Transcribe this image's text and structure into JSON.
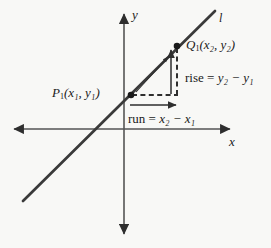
{
  "figure": {
    "type": "coordinate-plane-slope-diagram",
    "background_color": "#f8f8f6",
    "ink_color": "#3a3a3a",
    "text_color": "#1a1a1a",
    "width": 271,
    "height": 248
  },
  "axes": {
    "x_label": "x",
    "y_label": "y",
    "origin": {
      "x": 124,
      "y": 129
    },
    "x_axis": {
      "x1": 12,
      "y1": 129,
      "x2": 232,
      "y2": 129,
      "arrows": "both"
    },
    "y_axis": {
      "x1": 124,
      "y1": 12,
      "x2": 124,
      "y2": 236,
      "arrows": "both"
    }
  },
  "line": {
    "label": "l",
    "start": {
      "x": 23,
      "y": 201
    },
    "end": {
      "x": 215,
      "y": 11
    },
    "color": "#3a3a3a",
    "width": 2.6
  },
  "points": [
    {
      "id": "P1",
      "label": "P",
      "sub": "1",
      "coords": "(x₁, y₁)",
      "x": 131,
      "y": 95
    },
    {
      "id": "Q1",
      "label": "Q",
      "sub": "1",
      "coords": "(x₂, y₂)",
      "x": 177,
      "y": 46
    }
  ],
  "annotations": {
    "rise": {
      "text": "rise = y₂ − y₁",
      "prefix": "rise",
      "equals": "=",
      "expression": "y₂ − y₁",
      "arrow": {
        "x": 171,
        "y_from": 94,
        "y_to": 49,
        "direction": "up"
      },
      "dashed": {
        "x": 177,
        "y_from": 48,
        "y_to": 96
      }
    },
    "run": {
      "text": "run = x₂ − x₁",
      "prefix": "run",
      "equals": "=",
      "expression": "x₂ − x₁",
      "arrow": {
        "y": 105,
        "x_from": 130,
        "x_to": 178,
        "direction": "right"
      },
      "dashed": {
        "y": 95,
        "x_from": 133,
        "x_to": 177
      }
    },
    "direction_arrow": {
      "from": {
        "x": 136,
        "y": 92
      },
      "to": {
        "x": 169,
        "y": 56
      }
    }
  }
}
